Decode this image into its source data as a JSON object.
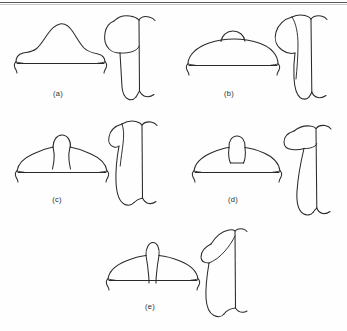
{
  "figure": {
    "type": "line-drawing-plate",
    "background_color": "#fefefe",
    "ink_color": "#2a2a2a",
    "rule_color": "#5a5a5a",
    "has_top_rule": true,
    "label_font_size_px": 7.5,
    "panel_count": 5,
    "views_per_panel": 2,
    "view_names": [
      "superior-view",
      "lateral-view"
    ]
  },
  "panels": [
    {
      "id": "a",
      "label": "(a)",
      "label_x": 55,
      "label_y": 92,
      "superior": {
        "name": "superior-view-a",
        "description": "wide hat-shaped outline with tall central dome, flanking shoulder waves and straight baseline with curled end feet"
      },
      "lateral": {
        "name": "lateral-view-a",
        "description": "pilcrow-like profile, bulbous head lobe at upper left joined to a long descending shaft with a separate vertical line at right"
      }
    },
    {
      "id": "b",
      "label": "(b)",
      "label_x": 238,
      "label_y": 92,
      "superior": {
        "name": "superior-view-b",
        "description": "broad low ellipse dome with a small central bump on top and a straight baseline with curled end feet"
      },
      "lateral": {
        "name": "lateral-view-b",
        "description": "round lobe at upper left overlapping a long narrow vertical body, with a separate vertical line at right"
      }
    },
    {
      "id": "c",
      "label": "(c)",
      "label_x": 54,
      "label_y": 197,
      "superior": {
        "name": "superior-view-c",
        "description": "low wide dome with a central round knob set on a short narrow neck formed by two inward curves"
      },
      "lateral": {
        "name": "lateral-view-c",
        "description": "elongated teardrop profile with a hooked lobe at top left and a straight vertical line at right"
      }
    },
    {
      "id": "d",
      "label": "(d)",
      "label_x": 236,
      "label_y": 197,
      "superior": {
        "name": "superior-view-d",
        "description": "low wide dome with a larger rounded central knob sitting directly on the dome crest"
      },
      "lateral": {
        "name": "lateral-view-d",
        "description": "narrow tapering profile with an angular flattened lobe at the top left and a vertical line at right"
      }
    },
    {
      "id": "e",
      "label": "(e)",
      "label_x": 150,
      "label_y": 302,
      "superior": {
        "name": "superior-view-e",
        "description": "wide dome split by a deep central V-cleft running to the baseline, with a round knob rising above the cleft"
      },
      "lateral": {
        "name": "lateral-view-e",
        "description": "slanted profile with an angular wedge lobe at the top leaning left and a vertical line at right"
      }
    }
  ]
}
